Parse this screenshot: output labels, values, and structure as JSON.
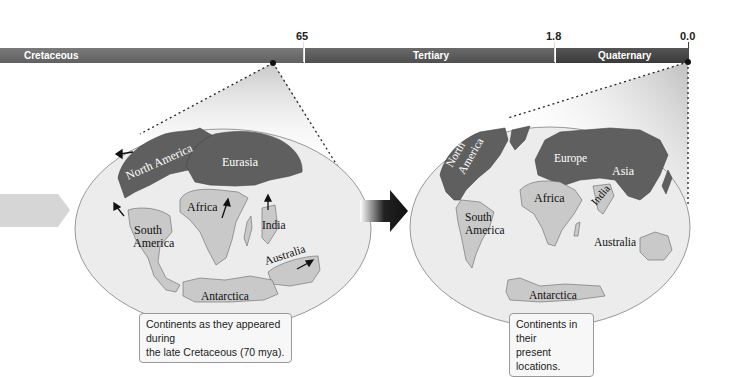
{
  "timeline": {
    "periods": [
      {
        "label": "Cretaceous",
        "color": "#6e6e6e"
      },
      {
        "label": "Tertiary",
        "color": "#5a5a5a"
      },
      {
        "label": "Quaternary",
        "color": "#454545"
      }
    ],
    "ticks": [
      {
        "label": "65"
      },
      {
        "label": "1.8"
      },
      {
        "label": "0.0"
      }
    ]
  },
  "left_map": {
    "continents": {
      "north_america": "North America",
      "eurasia": "Eurasia",
      "africa": "Africa",
      "south_america_1": "South",
      "south_america_2": "America",
      "india": "India",
      "australia": "Australia",
      "antarctica": "Antarctica"
    },
    "caption_line1": "Continents as they appeared during",
    "caption_line2": "the late Cretaceous (70 mya)."
  },
  "right_map": {
    "continents": {
      "north_america_1": "North",
      "north_america_2": "America",
      "europe": "Europe",
      "asia": "Asia",
      "africa": "Africa",
      "india": "India",
      "south_america_1": "South",
      "south_america_2": "America",
      "australia": "Australia",
      "antarctica": "Antarctica"
    },
    "caption_line1": "Continents in their",
    "caption_line2": "present locations."
  },
  "colors": {
    "dark_land": "#5f5f5f",
    "light_land": "#c9c9c9",
    "ocean": "#ececec"
  }
}
